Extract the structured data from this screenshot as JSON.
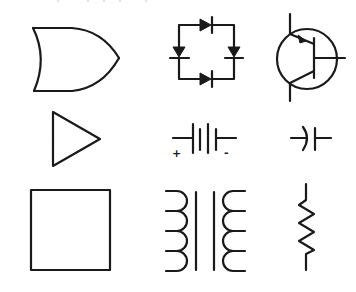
{
  "figure": {
    "title": "Electronic component schematic symbols",
    "grid": {
      "rows": 3,
      "cols": 3
    },
    "symbols": [
      {
        "row": 0,
        "col": 0,
        "name": "OR gate",
        "icon": "or-gate-icon"
      },
      {
        "row": 0,
        "col": 1,
        "name": "Bridge rectifier (4 diodes)",
        "icon": "bridge-rectifier-icon"
      },
      {
        "row": 0,
        "col": 2,
        "name": "PNP/NPN bipolar transistor",
        "icon": "transistor-icon"
      },
      {
        "row": 1,
        "col": 0,
        "name": "Buffer / amplifier",
        "icon": "buffer-triangle-icon"
      },
      {
        "row": 1,
        "col": 1,
        "name": "Battery",
        "icon": "battery-icon",
        "labels": {
          "positive": "+",
          "negative": "-"
        }
      },
      {
        "row": 1,
        "col": 2,
        "name": "Polarized capacitor",
        "icon": "capacitor-icon"
      },
      {
        "row": 2,
        "col": 0,
        "name": "Square / block",
        "icon": "block-square-icon"
      },
      {
        "row": 2,
        "col": 1,
        "name": "Transformer",
        "icon": "transformer-icon"
      },
      {
        "row": 2,
        "col": 2,
        "name": "Resistor",
        "icon": "resistor-icon"
      }
    ],
    "colors": {
      "line": "#1a1a1a",
      "background": "#ffffff"
    }
  }
}
